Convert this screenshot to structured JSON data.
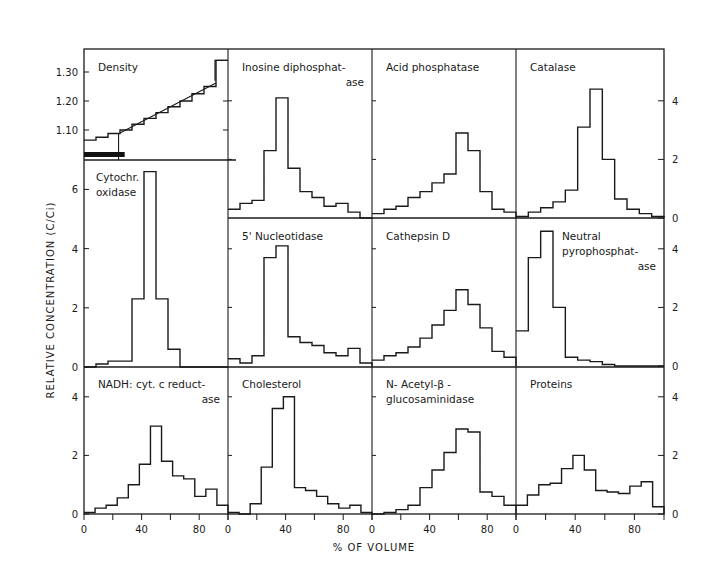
{
  "chart_data": {
    "type": "bar",
    "subtype": "step-histogram-grid",
    "xlabel": "% OF VOLUME",
    "ylabel": "RELATIVE CONCENTRATION (C/Ci)",
    "x_ticks": [
      0,
      40,
      80
    ],
    "x_range": [
      0,
      100
    ],
    "bin_edges": [
      0,
      8.33,
      16.67,
      25,
      33.33,
      41.67,
      50,
      58.33,
      66.67,
      75,
      83.33,
      91.67,
      100
    ],
    "panels": [
      {
        "id": "density",
        "title": [
          "Density"
        ],
        "row": 0,
        "col": 0,
        "ylim": [
          1.0,
          1.35
        ],
        "y_ticks": [
          1.1,
          1.2,
          1.3
        ],
        "y_tick_labels": [
          "1.10",
          "1.20",
          "1.30"
        ],
        "values": [
          1.065,
          1.075,
          1.088,
          1.1,
          1.12,
          1.14,
          1.16,
          1.18,
          1.2,
          1.225,
          1.25,
          1.34
        ],
        "density_line": [
          [
            25,
            1.09
          ],
          [
            100,
            1.29
          ]
        ],
        "sample_bar_x": [
          0,
          22
        ]
      },
      {
        "id": "cytochrome-oxidase",
        "title": [
          "Cytochr.",
          "oxidase"
        ],
        "row": 1,
        "col": 0,
        "ylim": [
          0,
          7
        ],
        "y_ticks": [
          0,
          2,
          4,
          6
        ],
        "values": [
          0,
          0.1,
          0.2,
          0.2,
          2.3,
          6.6,
          2.3,
          0.6,
          0,
          0,
          0,
          0
        ]
      },
      {
        "id": "inosine-diphosphatase",
        "title": [
          "Inosine diphosphat-",
          "ase"
        ],
        "row": 0,
        "col": 1,
        "ylim": [
          0,
          5.8
        ],
        "y_ticks": [
          0,
          2,
          4
        ],
        "values": [
          0.3,
          0.5,
          0.6,
          2.3,
          4.1,
          1.7,
          0.9,
          0.7,
          0.4,
          0.5,
          0.2,
          0.0
        ]
      },
      {
        "id": "acid-phosphatase",
        "title": [
          "Acid phosphatase"
        ],
        "row": 0,
        "col": 2,
        "ylim": [
          0,
          5.8
        ],
        "y_ticks": [
          0,
          2,
          4
        ],
        "values": [
          0.15,
          0.3,
          0.4,
          0.7,
          0.9,
          1.2,
          1.5,
          2.9,
          2.3,
          0.9,
          0.3,
          0.2
        ]
      },
      {
        "id": "catalase",
        "title": [
          "Catalase"
        ],
        "row": 0,
        "col": 3,
        "ylim": [
          0,
          5.8
        ],
        "y_ticks": [
          0,
          2,
          4
        ],
        "y_axis_side": "right",
        "values": [
          0.05,
          0.2,
          0.35,
          0.55,
          0.95,
          3.1,
          4.4,
          2.0,
          0.65,
          0.3,
          0.15,
          0.05
        ]
      },
      {
        "id": "5-nucleotidase",
        "title": [
          "5' Nucleotidase"
        ],
        "row": 1,
        "col": 1,
        "ylim": [
          0,
          5.2
        ],
        "y_ticks": [
          0,
          2,
          4
        ],
        "values": [
          0.25,
          0.1,
          0.35,
          3.7,
          4.1,
          1.0,
          0.8,
          0.7,
          0.45,
          0.35,
          0.6,
          0.1
        ]
      },
      {
        "id": "cathepsin-d",
        "title": [
          "Cathepsin D"
        ],
        "row": 1,
        "col": 2,
        "ylim": [
          0,
          5.2
        ],
        "y_ticks": [
          0,
          2,
          4
        ],
        "values": [
          0.2,
          0.35,
          0.45,
          0.65,
          0.95,
          1.4,
          1.9,
          2.6,
          2.1,
          1.3,
          0.5,
          0.3
        ]
      },
      {
        "id": "neutral-pyrophosphatase",
        "title": [
          "Neutral",
          "pyrophosphat-",
          "ase"
        ],
        "row": 1,
        "col": 3,
        "ylim": [
          0,
          5.2
        ],
        "y_ticks": [
          0,
          2,
          4
        ],
        "y_axis_side": "right",
        "values": [
          1.2,
          3.7,
          4.6,
          2.0,
          0.3,
          0.2,
          0.15,
          0.05,
          0.0,
          0.0,
          0.0,
          0.0
        ]
      },
      {
        "id": "nadh-cyt-c-reductase",
        "title": [
          "NADH: cyt. c reduct-",
          "ase"
        ],
        "row": 2,
        "col": 0,
        "ylim": [
          0,
          5.2
        ],
        "y_ticks": [
          0,
          2,
          4
        ],
        "values": [
          0.05,
          0.2,
          0.3,
          0.55,
          1.0,
          1.7,
          3.0,
          1.8,
          1.3,
          1.2,
          0.6,
          0.85,
          0.3
        ]
      },
      {
        "id": "cholesterol",
        "title": [
          "Cholesterol"
        ],
        "row": 2,
        "col": 1,
        "ylim": [
          0,
          5.2
        ],
        "y_ticks": [
          0,
          2,
          4
        ],
        "values": [
          0.05,
          0.0,
          0.35,
          1.6,
          3.6,
          4.0,
          0.9,
          0.8,
          0.6,
          0.35,
          0.2,
          0.3,
          0.05
        ]
      },
      {
        "id": "n-acetyl-beta-glucosaminidase",
        "title": [
          "N- Acetyl-β -",
          "glucosaminidase"
        ],
        "row": 2,
        "col": 2,
        "ylim": [
          0,
          5.2
        ],
        "y_ticks": [
          0,
          2,
          4
        ],
        "values": [
          0.0,
          0.05,
          0.15,
          0.3,
          0.9,
          1.5,
          2.1,
          2.9,
          2.8,
          0.75,
          0.6,
          0.3
        ]
      },
      {
        "id": "proteins",
        "title": [
          "Proteins"
        ],
        "row": 2,
        "col": 3,
        "ylim": [
          0,
          5.2
        ],
        "y_ticks": [
          0,
          2,
          4
        ],
        "y_axis_side": "right",
        "values": [
          0.3,
          0.65,
          1.0,
          1.05,
          1.55,
          2.0,
          1.5,
          0.8,
          0.75,
          0.7,
          0.95,
          1.1,
          0.25
        ]
      }
    ],
    "grid": false,
    "legend": "none"
  },
  "labels": {
    "xlabel": "% OF VOLUME",
    "ylabel": "RELATIVE CONCENTRATION (C/Ci)"
  }
}
